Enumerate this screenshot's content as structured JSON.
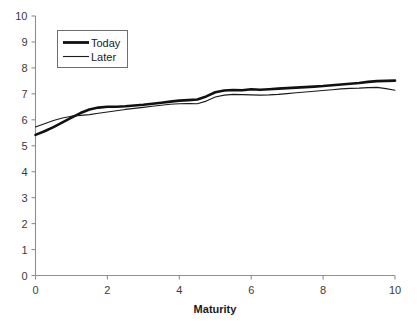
{
  "chart_data": {
    "type": "line",
    "title": "",
    "xlabel": "Maturity",
    "ylabel": "",
    "xlim": [
      0,
      10
    ],
    "ylim": [
      0,
      10
    ],
    "grid": false,
    "legend_position": "top-left",
    "xticks": [
      0,
      2,
      4,
      6,
      8,
      10
    ],
    "yticks": [
      0,
      1,
      2,
      3,
      4,
      5,
      6,
      7,
      8,
      9,
      10
    ],
    "xtick_labels": [
      "0",
      "2",
      "4",
      "6",
      "8",
      "10"
    ],
    "ytick_labels": [
      "0",
      "1",
      "2",
      "3",
      "4",
      "5",
      "6",
      "7",
      "8",
      "9",
      "10"
    ],
    "x": [
      0.0,
      0.25,
      0.5,
      0.75,
      1.0,
      1.25,
      1.5,
      1.75,
      2.0,
      2.25,
      2.5,
      2.75,
      3.0,
      3.25,
      3.5,
      3.75,
      4.0,
      4.25,
      4.5,
      4.75,
      5.0,
      5.25,
      5.5,
      5.75,
      6.0,
      6.25,
      6.5,
      6.75,
      7.0,
      7.25,
      7.5,
      7.75,
      8.0,
      8.25,
      8.5,
      8.75,
      9.0,
      9.25,
      9.5,
      9.75,
      10.0
    ],
    "series": [
      {
        "name": "Today",
        "color": "#111111",
        "linewidth": 2.6,
        "values": [
          5.42,
          5.56,
          5.72,
          5.9,
          6.08,
          6.26,
          6.4,
          6.47,
          6.5,
          6.5,
          6.52,
          6.55,
          6.58,
          6.62,
          6.66,
          6.7,
          6.74,
          6.76,
          6.78,
          6.9,
          7.06,
          7.13,
          7.15,
          7.14,
          7.18,
          7.16,
          7.18,
          7.2,
          7.22,
          7.24,
          7.26,
          7.28,
          7.3,
          7.33,
          7.36,
          7.39,
          7.42,
          7.46,
          7.49,
          7.5,
          7.51
        ]
      },
      {
        "name": "Later",
        "color": "#1a1a1a",
        "linewidth": 1.1,
        "values": [
          5.72,
          5.85,
          5.97,
          6.07,
          6.14,
          6.17,
          6.2,
          6.25,
          6.3,
          6.35,
          6.4,
          6.44,
          6.48,
          6.52,
          6.56,
          6.6,
          6.62,
          6.63,
          6.62,
          6.72,
          6.88,
          6.95,
          6.98,
          6.97,
          6.96,
          6.95,
          6.96,
          6.98,
          7.01,
          7.04,
          7.07,
          7.1,
          7.13,
          7.16,
          7.19,
          7.21,
          7.22,
          7.24,
          7.25,
          7.2,
          7.14
        ]
      }
    ]
  },
  "legend": {
    "entries": [
      {
        "label": "Today"
      },
      {
        "label": "Later"
      }
    ]
  },
  "axes": {
    "x_title": "Maturity"
  }
}
